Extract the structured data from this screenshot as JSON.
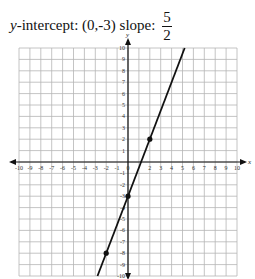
{
  "caption": {
    "intercept_label": "y",
    "intercept_text": "-intercept: (0,-3) slope:",
    "slope_numerator": "5",
    "slope_denominator": "2"
  },
  "chart_data": {
    "type": "line",
    "xlabel": "x",
    "ylabel": "y",
    "xlim": [
      -10,
      10
    ],
    "ylim": [
      -10,
      10
    ],
    "grid": true,
    "x_ticks": [
      -10,
      -9,
      -8,
      -7,
      -6,
      -5,
      -4,
      -3,
      -2,
      -1,
      0,
      2,
      3,
      4,
      5,
      6,
      7,
      8,
      9,
      10
    ],
    "y_ticks": [
      10,
      9,
      8,
      7,
      6,
      5,
      4,
      3,
      2,
      1,
      -1,
      -2,
      -3,
      -4,
      -5,
      -6,
      -7,
      -8,
      -9,
      -10
    ],
    "line": {
      "slope": 2.5,
      "intercept": -3,
      "x_start": -2.8,
      "y_start": -10,
      "x_end": 5.2,
      "y_end": 10
    },
    "points": [
      {
        "x": -2,
        "y": -8
      },
      {
        "x": 0,
        "y": -3
      },
      {
        "x": 2,
        "y": 2
      }
    ],
    "colors": {
      "grid": "#b5b5b5",
      "axis": "#111111",
      "line": "#111111"
    }
  }
}
